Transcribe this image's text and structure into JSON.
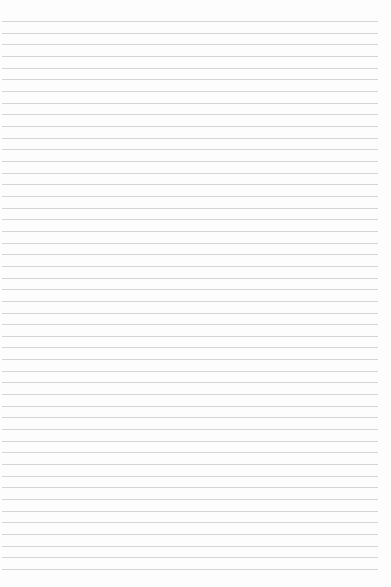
{
  "paper": {
    "type": "lined-paper",
    "background_color": "#fdfdfd",
    "line_color": "#d6d6d6",
    "line_count": 48,
    "first_line_y": 21,
    "line_spacing": 11.66,
    "line_left": 2,
    "line_right": 378
  }
}
